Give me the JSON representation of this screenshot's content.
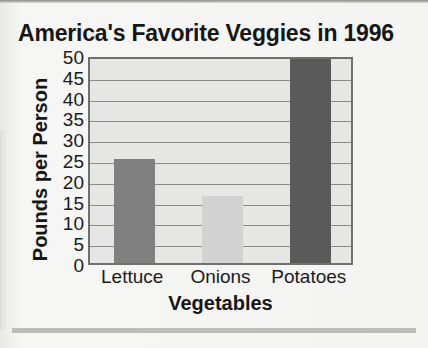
{
  "chart_data": {
    "type": "bar",
    "title": "America's Favorite Veggies in 1996",
    "xlabel": "Vegetables",
    "ylabel": "Pounds per Person",
    "categories": [
      "Lettuce",
      "Onions",
      "Potatoes"
    ],
    "values": [
      25,
      16,
      49
    ],
    "bar_colors": [
      "#808080",
      "#d2d2d2",
      "#5a5a5a"
    ],
    "ylim": [
      0,
      50
    ],
    "ytick_step": 5,
    "yticks": [
      50,
      45,
      40,
      35,
      30,
      25,
      20,
      15,
      10,
      5,
      0
    ],
    "grid": true,
    "legend": "none",
    "plot_background": "#e6e6e4",
    "frame_color": "#6f6f6f",
    "gridline_color": "#8a8a8a",
    "text_color": "#161616"
  },
  "page": {
    "background": "#f4f4f2",
    "rule_color": "#bcbcbc"
  }
}
